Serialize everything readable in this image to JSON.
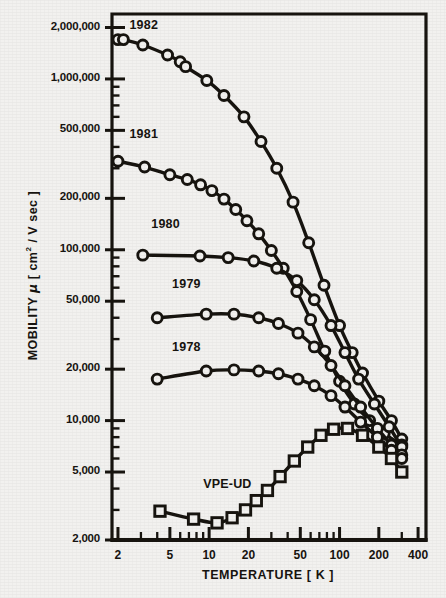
{
  "chart_data": {
    "type": "line",
    "title": "",
    "xlabel": "TEMPERATURE  [ K ]",
    "ylabel": "MOBILITY μ [ cm² / V sec ]",
    "xscale": "log",
    "yscale": "log",
    "xlim": [
      1.8,
      460
    ],
    "ylim": [
      2000,
      2400000
    ],
    "grid": false,
    "legend": "inline-labels",
    "xticks": [
      2,
      5,
      10,
      20,
      50,
      100,
      200,
      400
    ],
    "xtick_labels": [
      "2",
      "5",
      "10",
      "20",
      "50",
      "100",
      "200",
      "400"
    ],
    "yticks": [
      2000,
      5000,
      10000,
      20000,
      50000,
      100000,
      200000,
      500000,
      1000000,
      2000000
    ],
    "ytick_labels": [
      "2,000",
      "5,000",
      "10,000",
      "20,000",
      "50,000",
      "100,000",
      "200,000",
      "500,000",
      "1,000,000",
      "2,000,000"
    ],
    "marker_open": true,
    "series": [
      {
        "name": "1982",
        "marker": "circle",
        "label_x": 2.45,
        "label_y": 2050000,
        "points": [
          [
            2.0,
            1700000
          ],
          [
            2.2,
            1700000
          ],
          [
            3.1,
            1580000
          ],
          [
            4.8,
            1380000
          ],
          [
            6.0,
            1260000
          ],
          [
            6.6,
            1180000
          ],
          [
            9.6,
            980000
          ],
          [
            13.0,
            800000
          ],
          [
            18.5,
            600000
          ],
          [
            25.0,
            430000
          ],
          [
            33.0,
            300000
          ],
          [
            44.0,
            190000
          ],
          [
            58.0,
            110000
          ],
          [
            76.0,
            62000
          ],
          [
            100.0,
            36000
          ],
          [
            125.0,
            25000
          ],
          [
            150.0,
            19000
          ],
          [
            200.0,
            13000
          ],
          [
            250.0,
            10000
          ],
          [
            300.0,
            7800
          ]
        ]
      },
      {
        "name": "1981",
        "marker": "circle",
        "label_x": 2.45,
        "label_y": 470000,
        "points": [
          [
            2.0,
            330000
          ],
          [
            3.2,
            305000
          ],
          [
            5.0,
            275000
          ],
          [
            6.8,
            258000
          ],
          [
            8.6,
            240000
          ],
          [
            10.5,
            222000
          ],
          [
            13.0,
            198000
          ],
          [
            16.0,
            172000
          ],
          [
            19.5,
            148000
          ],
          [
            24.0,
            124000
          ],
          [
            30.0,
            99000
          ],
          [
            37.0,
            78000
          ],
          [
            47.0,
            57000
          ],
          [
            60.0,
            39000
          ],
          [
            77.0,
            25500
          ],
          [
            100.0,
            17000
          ],
          [
            130.0,
            12500
          ],
          [
            170.0,
            10000
          ],
          [
            220.0,
            8400
          ],
          [
            300.0,
            7200
          ]
        ]
      },
      {
        "name": "1980",
        "marker": "circle",
        "label_x": 3.6,
        "label_y": 140000,
        "points": [
          [
            3.1,
            93000
          ],
          [
            8.5,
            92000
          ],
          [
            14.0,
            90000
          ],
          [
            22.0,
            86000
          ],
          [
            33.0,
            78000
          ],
          [
            47.0,
            66000
          ],
          [
            64.0,
            51000
          ],
          [
            86.0,
            36000
          ],
          [
            110.0,
            25000
          ],
          [
            140.0,
            17500
          ],
          [
            185.0,
            12500
          ],
          [
            240.0,
            9200
          ],
          [
            300.0,
            7000
          ]
        ]
      },
      {
        "name": "1979",
        "marker": "circle",
        "label_x": 5.2,
        "label_y": 62000,
        "points": [
          [
            4.0,
            40000
          ],
          [
            9.5,
            42000
          ],
          [
            15.5,
            42000
          ],
          [
            24.0,
            40000
          ],
          [
            34.0,
            37000
          ],
          [
            48.0,
            32500
          ],
          [
            64.0,
            27000
          ],
          [
            86.0,
            21000
          ],
          [
            110.0,
            16000
          ],
          [
            145.0,
            12000
          ],
          [
            195.0,
            9000
          ],
          [
            250.0,
            7200
          ],
          [
            300.0,
            6300
          ]
        ]
      },
      {
        "name": "1978",
        "marker": "circle",
        "label_x": 5.2,
        "label_y": 26500,
        "points": [
          [
            4.0,
            17500
          ],
          [
            9.5,
            19500
          ],
          [
            15.5,
            19800
          ],
          [
            24.0,
            19500
          ],
          [
            34.0,
            18800
          ],
          [
            48.0,
            17500
          ],
          [
            64.0,
            16000
          ],
          [
            86.0,
            14000
          ],
          [
            110.0,
            12000
          ],
          [
            145.0,
            9800
          ],
          [
            195.0,
            8000
          ],
          [
            250.0,
            6700
          ],
          [
            300.0,
            6000
          ]
        ]
      },
      {
        "name": "VPE-UD",
        "marker": "square",
        "label_x": 9.0,
        "label_y": 4200,
        "points": [
          [
            4.2,
            2950
          ],
          [
            7.6,
            2650
          ],
          [
            11.5,
            2520
          ],
          [
            15.0,
            2700
          ],
          [
            19.0,
            3000
          ],
          [
            23.0,
            3400
          ],
          [
            28.0,
            3900
          ],
          [
            35.0,
            4700
          ],
          [
            45.0,
            5800
          ],
          [
            57.0,
            7000
          ],
          [
            72.0,
            8200
          ],
          [
            90.0,
            8900
          ],
          [
            115.0,
            9000
          ],
          [
            150.0,
            8200
          ],
          [
            200.0,
            7000
          ],
          [
            250.0,
            6000
          ],
          [
            300.0,
            5000
          ]
        ]
      }
    ]
  }
}
